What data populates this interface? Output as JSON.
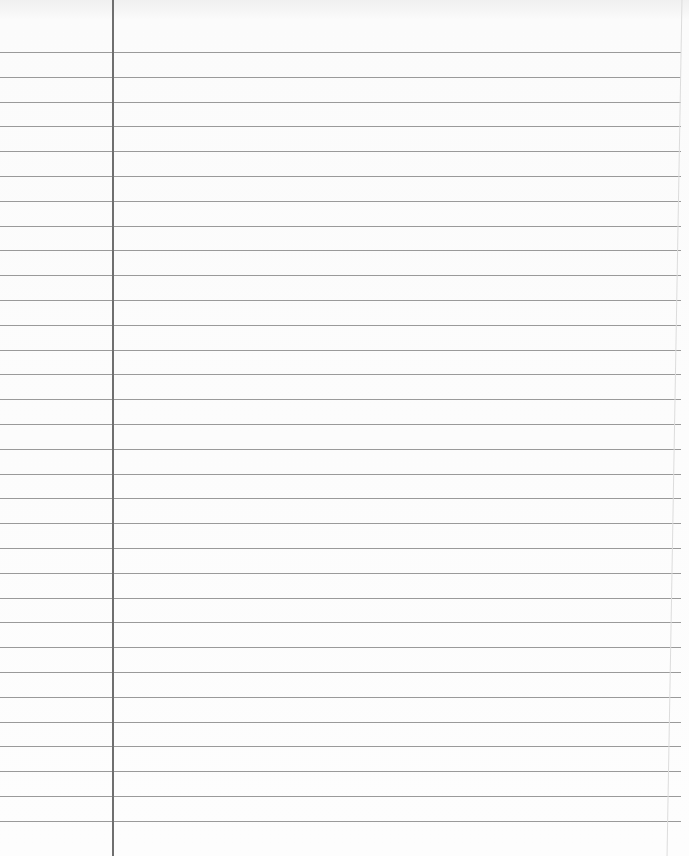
{
  "paper": {
    "type": "lined notebook paper",
    "rule_color": "#9a9a9a",
    "margin_color": "#6f6f6f",
    "background": "#fdfdfd",
    "margin_x": 112,
    "first_rule_y": 52,
    "rule_spacing": 24.8,
    "rule_count": 32
  }
}
